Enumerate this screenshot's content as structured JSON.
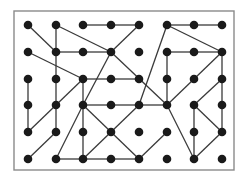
{
  "diagram": {
    "type": "grid-graph",
    "frame": {
      "x": 14,
      "y": 11,
      "width": 220,
      "height": 159,
      "stroke": "#8a8a8a"
    },
    "colors": {
      "node": "#1a1a1a",
      "edge": "#3a3a3a",
      "background": "#ffffff"
    },
    "columns_x": [
      28,
      56,
      83,
      111,
      139,
      167,
      194,
      222
    ],
    "rows_y": [
      25,
      52,
      79,
      105,
      132,
      159
    ],
    "node_radius": 4.3,
    "nodes": "all 8x6 grid points",
    "edges": [
      [
        [
          0,
          0
        ],
        [
          1,
          1
        ]
      ],
      [
        [
          1,
          0
        ],
        [
          1,
          1
        ]
      ],
      [
        [
          1,
          0
        ],
        [
          3,
          1
        ]
      ],
      [
        [
          2,
          0
        ],
        [
          3,
          0
        ]
      ],
      [
        [
          3,
          0
        ],
        [
          4,
          0
        ]
      ],
      [
        [
          4,
          0
        ],
        [
          3,
          1
        ]
      ],
      [
        [
          5,
          0
        ],
        [
          6,
          0
        ]
      ],
      [
        [
          6,
          0
        ],
        [
          7,
          0
        ]
      ],
      [
        [
          5,
          0
        ],
        [
          7,
          1
        ]
      ],
      [
        [
          5,
          0
        ],
        [
          4,
          3
        ]
      ],
      [
        [
          1,
          1
        ],
        [
          2,
          1
        ]
      ],
      [
        [
          2,
          1
        ],
        [
          3,
          1
        ]
      ],
      [
        [
          1,
          1
        ],
        [
          1,
          2
        ]
      ],
      [
        [
          0,
          1
        ],
        [
          2,
          2
        ]
      ],
      [
        [
          3,
          1
        ],
        [
          5,
          3
        ]
      ],
      [
        [
          3,
          1
        ],
        [
          2,
          3
        ]
      ],
      [
        [
          5,
          1
        ],
        [
          6,
          1
        ]
      ],
      [
        [
          6,
          1
        ],
        [
          7,
          1
        ]
      ],
      [
        [
          5,
          1
        ],
        [
          5,
          2
        ]
      ],
      [
        [
          7,
          1
        ],
        [
          6,
          2
        ]
      ],
      [
        [
          7,
          1
        ],
        [
          7,
          2
        ]
      ],
      [
        [
          2,
          2
        ],
        [
          3,
          2
        ]
      ],
      [
        [
          3,
          2
        ],
        [
          4,
          2
        ]
      ],
      [
        [
          0,
          2
        ],
        [
          0,
          3
        ]
      ],
      [
        [
          1,
          2
        ],
        [
          1,
          3
        ]
      ],
      [
        [
          2,
          2
        ],
        [
          2,
          3
        ]
      ],
      [
        [
          2,
          2
        ],
        [
          1,
          3
        ]
      ],
      [
        [
          5,
          2
        ],
        [
          5,
          3
        ]
      ],
      [
        [
          6,
          2
        ],
        [
          5,
          3
        ]
      ],
      [
        [
          7,
          2
        ],
        [
          6,
          3
        ]
      ],
      [
        [
          7,
          2
        ],
        [
          7,
          3
        ]
      ],
      [
        [
          0,
          3
        ],
        [
          0,
          4
        ]
      ],
      [
        [
          1,
          3
        ],
        [
          0,
          4
        ]
      ],
      [
        [
          1,
          3
        ],
        [
          1,
          4
        ]
      ],
      [
        [
          2,
          3
        ],
        [
          3,
          3
        ]
      ],
      [
        [
          3,
          3
        ],
        [
          4,
          3
        ]
      ],
      [
        [
          4,
          3
        ],
        [
          5,
          3
        ]
      ],
      [
        [
          2,
          3
        ],
        [
          2,
          4
        ]
      ],
      [
        [
          2,
          3
        ],
        [
          1,
          5
        ]
      ],
      [
        [
          2,
          3
        ],
        [
          3,
          4
        ]
      ],
      [
        [
          4,
          3
        ],
        [
          3,
          4
        ]
      ],
      [
        [
          5,
          3
        ],
        [
          6,
          5
        ]
      ],
      [
        [
          6,
          3
        ],
        [
          6,
          4
        ]
      ],
      [
        [
          6,
          3
        ],
        [
          7,
          4
        ]
      ],
      [
        [
          7,
          3
        ],
        [
          7,
          4
        ]
      ],
      [
        [
          1,
          4
        ],
        [
          0,
          5
        ]
      ],
      [
        [
          2,
          4
        ],
        [
          2,
          5
        ]
      ],
      [
        [
          3,
          4
        ],
        [
          2,
          5
        ]
      ],
      [
        [
          3,
          4
        ],
        [
          4,
          5
        ]
      ],
      [
        [
          5,
          4
        ],
        [
          4,
          5
        ]
      ],
      [
        [
          6,
          4
        ],
        [
          6,
          5
        ]
      ],
      [
        [
          7,
          4
        ],
        [
          6,
          5
        ]
      ],
      [
        [
          1,
          5
        ],
        [
          2,
          5
        ]
      ],
      [
        [
          2,
          5
        ],
        [
          3,
          5
        ]
      ],
      [
        [
          3,
          5
        ],
        [
          4,
          5
        ]
      ]
    ]
  }
}
